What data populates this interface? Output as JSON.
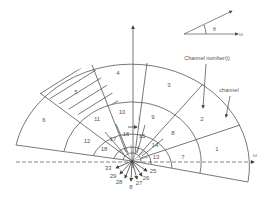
{
  "diagram": {
    "type": "polar channel partition diagram",
    "annotations": {
      "theta_label": "θ",
      "channel_number_label": "Channel number(i)",
      "channel_label": "channel",
      "horizontal_axis_label": "ω",
      "angle_axis_label": "ω"
    },
    "outer_ring_channels": [
      "1",
      "2",
      "3",
      "4",
      "5",
      "6"
    ],
    "ring2_channels": [
      "7",
      "8",
      "9",
      "10",
      "11",
      "12"
    ],
    "ring3_channels": [
      "13",
      "14",
      "15",
      "16",
      "17",
      "18"
    ],
    "ring4_channels": [
      "19",
      "20",
      "21",
      "22",
      "23",
      "24"
    ],
    "radial_arrow_labels": [
      "33",
      "29",
      "28",
      "8",
      "27",
      "26",
      "25"
    ],
    "highlighted_channel": "5",
    "small_inner_marks": [
      "i"
    ]
  }
}
